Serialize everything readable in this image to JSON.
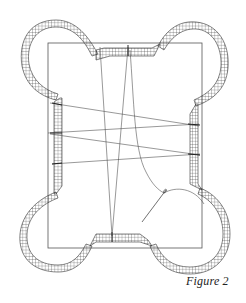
{
  "figure": {
    "caption": "Figure 2",
    "colors": {
      "ink": "#333333",
      "background": "#ffffff"
    },
    "frame": {
      "x": 48,
      "y": 43,
      "width": 154,
      "height": 205
    },
    "corner_lobes": [
      "top-left",
      "top-right",
      "bottom-left",
      "bottom-right"
    ],
    "edge_strips": [
      "top",
      "bottom",
      "left",
      "right"
    ],
    "threads": {
      "cross_lines": [
        {
          "from": [
            52,
            103
          ],
          "to": [
            197,
            126
          ]
        },
        {
          "from": [
            52,
            133
          ],
          "to": [
            197,
            124
          ]
        },
        {
          "from": [
            52,
            134
          ],
          "to": [
            198,
            155
          ]
        },
        {
          "from": [
            55,
            164
          ],
          "to": [
            198,
            154
          ]
        }
      ],
      "converging_lines": [
        {
          "from": [
            100,
            47
          ],
          "to": [
            112,
            236
          ]
        },
        {
          "from": [
            128,
            47
          ],
          "to": [
            112,
            236
          ]
        }
      ],
      "needle": {
        "position": [
          164,
          193
        ]
      }
    }
  }
}
